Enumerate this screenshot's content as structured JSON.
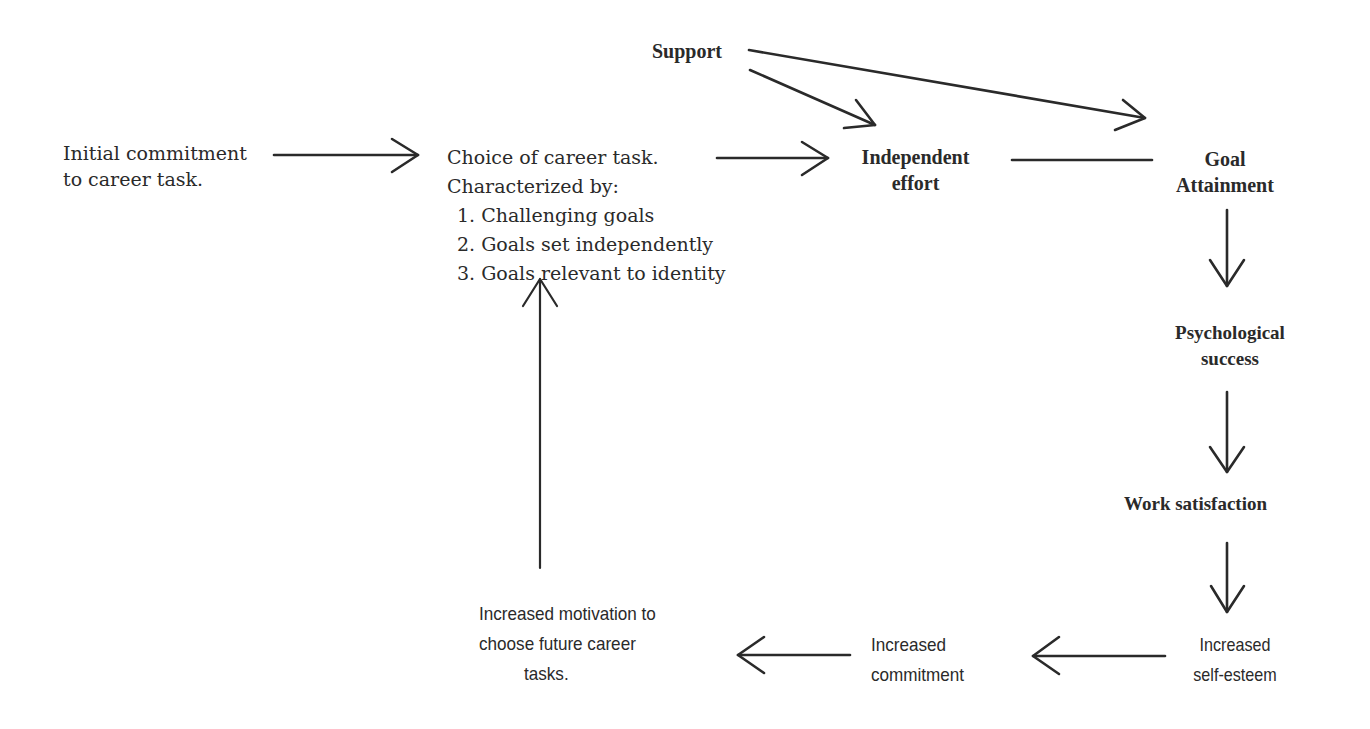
{
  "diagram": {
    "nodes": {
      "initial_commitment": {
        "lines": [
          "Initial commitment",
          "to career task."
        ]
      },
      "choice_of_task": {
        "lines": [
          "Choice of career task.",
          "Characterized by:"
        ],
        "items": [
          "1. Challenging goals",
          "2. Goals set independently",
          "3. Goals relevant to identity"
        ]
      },
      "support": {
        "label": "Support"
      },
      "independent_effort": {
        "lines": [
          "Independent",
          "effort"
        ]
      },
      "goal_attainment": {
        "lines": [
          "Goal",
          "Attainment"
        ]
      },
      "psychological_success": {
        "lines": [
          "Psychological",
          "success"
        ]
      },
      "work_satisfaction": {
        "label": "Work satisfaction"
      },
      "increased_self_esteem": {
        "lines": [
          "Increased",
          "self-esteem"
        ]
      },
      "increased_commitment": {
        "lines": [
          "Increased",
          "commitment"
        ]
      },
      "increased_motivation": {
        "lines": [
          "Increased motivation to",
          "choose future career",
          "tasks."
        ]
      }
    },
    "edges": [
      {
        "from": "initial_commitment",
        "to": "choice_of_task"
      },
      {
        "from": "choice_of_task",
        "to": "independent_effort"
      },
      {
        "from": "support",
        "to": "independent_effort"
      },
      {
        "from": "support",
        "to": "goal_attainment"
      },
      {
        "from": "independent_effort",
        "to": "goal_attainment"
      },
      {
        "from": "goal_attainment",
        "to": "psychological_success"
      },
      {
        "from": "psychological_success",
        "to": "work_satisfaction"
      },
      {
        "from": "work_satisfaction",
        "to": "increased_self_esteem"
      },
      {
        "from": "increased_self_esteem",
        "to": "increased_commitment"
      },
      {
        "from": "increased_commitment",
        "to": "increased_motivation"
      },
      {
        "from": "increased_motivation",
        "to": "choice_of_task"
      }
    ],
    "colors": {
      "ink": "#2a2a2a",
      "background": "#ffffff"
    }
  }
}
